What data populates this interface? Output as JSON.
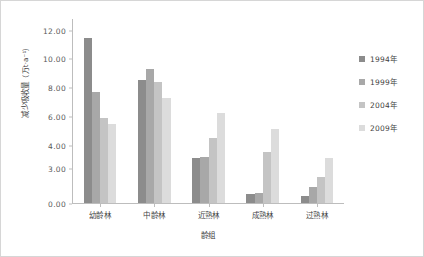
{
  "chart_data": {
    "type": "bar",
    "title": "",
    "subtitle": "",
    "xlabel": "龄组",
    "ylabel": "减少吸收量（万t·a⁻¹）",
    "ylabel_text": "减少吸收量",
    "ylabel_unit": "（万t·a⁻¹）",
    "categories": [
      "幼龄林",
      "中龄林",
      "近熟林",
      "成熟林",
      "过熟林"
    ],
    "series": [
      {
        "name": "1994年",
        "color": "#8c8c8c",
        "values": [
          11.4,
          8.5,
          3.1,
          0.6,
          0.5
        ]
      },
      {
        "name": "1999年",
        "color": "#a8a8a8",
        "values": [
          7.7,
          9.3,
          3.2,
          0.7,
          1.1
        ]
      },
      {
        "name": "2004年",
        "color": "#c4c4c4",
        "values": [
          5.9,
          8.4,
          4.5,
          3.5,
          1.8
        ]
      },
      {
        "name": "2009年",
        "color": "#dcdcdc",
        "values": [
          5.5,
          7.3,
          6.2,
          5.1,
          3.1
        ]
      }
    ],
    "yticks": [
      "12.00",
      "10.00",
      "8.00",
      "6.00",
      "4.00",
      "3.00",
      "0.00"
    ],
    "ytick_values": [
      12.0,
      10.0,
      8.0,
      6.0,
      4.0,
      3.0,
      0.0
    ],
    "ytick_positions": [
      12.0,
      10.0,
      8.0,
      6.0,
      4.0,
      2.45,
      0.0
    ],
    "ylim": [
      0,
      12.8
    ],
    "grid": false,
    "legend_position": "right",
    "axis_color": "#bdbdbd",
    "border_color": "#d6d6d6",
    "background": "#ffffff"
  },
  "legend": {
    "items": [
      {
        "label": "1994年"
      },
      {
        "label": "1999年"
      },
      {
        "label": "2004年"
      },
      {
        "label": "2009年"
      }
    ]
  }
}
